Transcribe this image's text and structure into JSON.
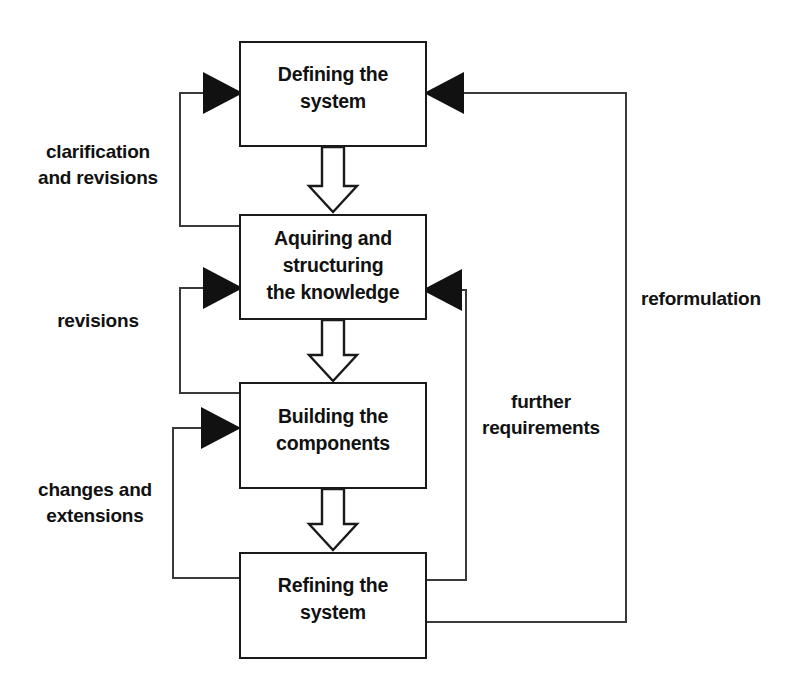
{
  "diagram": {
    "colors": {
      "background": "#ffffff",
      "box_fill": "#ffffff",
      "box_stroke": "#1a1a1a",
      "line": "#3a3a3a",
      "arrow_fill": "#111111",
      "text": "#111111"
    },
    "boxes": [
      {
        "id": "defining-the-system",
        "line1": "Defining the",
        "line2": "system",
        "line3": ""
      },
      {
        "id": "aquiring-and-structuring-the-knowledge",
        "line1": "Aquiring and",
        "line2": "structuring",
        "line3": "the knowledge"
      },
      {
        "id": "building-the-components",
        "line1": "Building the",
        "line2": "components",
        "line3": ""
      },
      {
        "id": "refining-the-system",
        "line1": "Refining the",
        "line2": "system",
        "line3": ""
      }
    ],
    "edge_labels": {
      "clarification_and_revisions_line1": "clarification",
      "clarification_and_revisions_line2": "and revisions",
      "revisions": "revisions",
      "changes_and_extensions_line1": "changes and",
      "changes_and_extensions_line2": "extensions",
      "further_requirements_line1": "further",
      "further_requirements_line2": "requirements",
      "reformulation": "reformulation"
    }
  }
}
